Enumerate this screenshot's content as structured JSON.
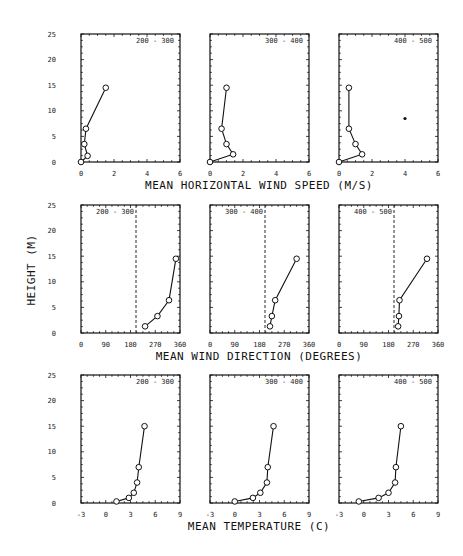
{
  "chart_data": {
    "type": "line",
    "title": "",
    "ylabel": "HEIGHT (M)",
    "y_ticks": [
      0,
      5,
      10,
      15,
      20,
      25
    ],
    "ylim": [
      0,
      25
    ],
    "grid": false,
    "rows": [
      {
        "xlabel": "MEAN HORIZONTAL WIND SPEED (M/S)",
        "xlim": [
          0,
          6
        ],
        "x_ticks": [
          0,
          2,
          4,
          6
        ],
        "reference_line": null,
        "panels": [
          {
            "label": "200 - 300",
            "label_pos": "right",
            "points": [
              [
                0,
                0
              ],
              [
                0.4,
                1.2
              ],
              [
                0.2,
                3.5
              ],
              [
                0.3,
                6.5
              ],
              [
                1.5,
                14.5
              ]
            ]
          },
          {
            "label": "300 - 400",
            "label_pos": "right",
            "points": [
              [
                0,
                0
              ],
              [
                1.4,
                1.5
              ],
              [
                1.0,
                3.5
              ],
              [
                0.7,
                6.5
              ],
              [
                1.0,
                14.5
              ]
            ]
          },
          {
            "label": "400 - 500",
            "label_pos": "right",
            "points": [
              [
                0,
                0
              ],
              [
                1.4,
                1.5
              ],
              [
                1.0,
                3.5
              ],
              [
                0.6,
                6.5
              ],
              [
                0.6,
                14.5
              ]
            ],
            "stray_mark": [
              4.0,
              8.5
            ]
          }
        ]
      },
      {
        "xlabel": "MEAN WIND DIRECTION (DEGREES)",
        "xlim": [
          0,
          360
        ],
        "x_ticks": [
          0,
          90,
          180,
          270,
          360
        ],
        "reference_line": 200,
        "panels": [
          {
            "label": "200 - 300",
            "label_pos": "left",
            "points": [
              [
                233,
                1.3
              ],
              [
                278,
                3.3
              ],
              [
                320,
                6.4
              ],
              [
                345,
                14.5
              ]
            ]
          },
          {
            "label": "300 - 400",
            "label_pos": "left",
            "points": [
              [
                218,
                1.3
              ],
              [
                225,
                3.3
              ],
              [
                237,
                6.4
              ],
              [
                315,
                14.5
              ]
            ]
          },
          {
            "label": "400 - 500",
            "label_pos": "left",
            "points": [
              [
                215,
                1.3
              ],
              [
                218,
                3.3
              ],
              [
                220,
                6.4
              ],
              [
                320,
                14.5
              ]
            ]
          }
        ]
      },
      {
        "xlabel": "MEAN TEMPERATURE (C)",
        "xlim": [
          -3,
          9
        ],
        "x_ticks": [
          -3,
          0,
          3,
          6,
          9
        ],
        "reference_line": null,
        "panels": [
          {
            "label": "200 - 300",
            "label_pos": "right",
            "points": [
              [
                1.3,
                0.3
              ],
              [
                2.8,
                1
              ],
              [
                3.4,
                2
              ],
              [
                3.8,
                4
              ],
              [
                4.0,
                7
              ],
              [
                4.7,
                15
              ]
            ]
          },
          {
            "label": "300 - 400",
            "label_pos": "right",
            "points": [
              [
                0,
                0.3
              ],
              [
                2.2,
                1
              ],
              [
                3.1,
                2
              ],
              [
                3.9,
                4
              ],
              [
                4.0,
                7
              ],
              [
                4.7,
                15
              ]
            ]
          },
          {
            "label": "400 - 500",
            "label_pos": "right",
            "points": [
              [
                -0.6,
                0.3
              ],
              [
                1.8,
                1
              ],
              [
                3.0,
                2
              ],
              [
                3.8,
                4
              ],
              [
                3.9,
                7
              ],
              [
                4.5,
                15
              ]
            ]
          }
        ]
      }
    ]
  },
  "layout": {
    "panel_x": [
      81,
      210,
      339
    ],
    "panel_width": 99,
    "row_y": [
      [
        34,
        162
      ],
      [
        205,
        333
      ],
      [
        375,
        503
      ]
    ]
  }
}
